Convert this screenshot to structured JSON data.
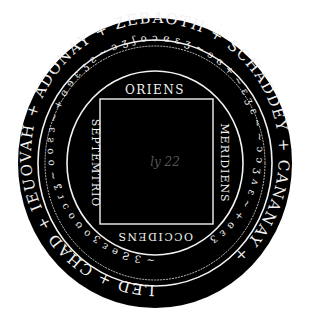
{
  "seal": {
    "outer_ring_text": "LED + CHAD + IEUOVAH + ADONAY + ZEBAOTH + SCHADDEY + CANANAY + ",
    "middle_ring_text": "~ 3 Ƨ e ɛ ʒ o ʊ o ɔ ɾ ʓ ~ o o ƨ ɜ ~ + ɞ ɘ ɛ ʒ ɛ ~ ɔ ʒ ʃ o ɔ ɞ ɛ ʒ ~ ɘ ɞ + ~ ɛ ʒ ɛ ~ ~ ɔ ɔ ʒ ʌ ɛ ~ + ɞ ɛ ʒ",
    "directions": {
      "top": "ORIENS",
      "left": "SEPTEMTRIO",
      "right": "MERIDIENS",
      "bottom": "OCCIDENS"
    },
    "center_label": "ly 22",
    "colors": {
      "background": "#ffffff",
      "seal": "#000000",
      "lines": "#f2f2f2"
    }
  }
}
